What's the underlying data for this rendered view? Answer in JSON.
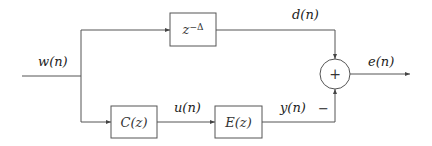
{
  "diagram": {
    "signals": {
      "input": "w(n)",
      "desired": "d(n)",
      "control": "u(n)",
      "output_y": "y(n)",
      "error": "e(n)",
      "minus_sign": "−"
    },
    "blocks": {
      "delay": "z",
      "delay_exp": "−Δ",
      "controller": "C(z)",
      "plant": "E(z)",
      "summer": "+"
    },
    "colors": {
      "line": "#555555",
      "text": "#222222",
      "background": "#ffffff"
    }
  }
}
